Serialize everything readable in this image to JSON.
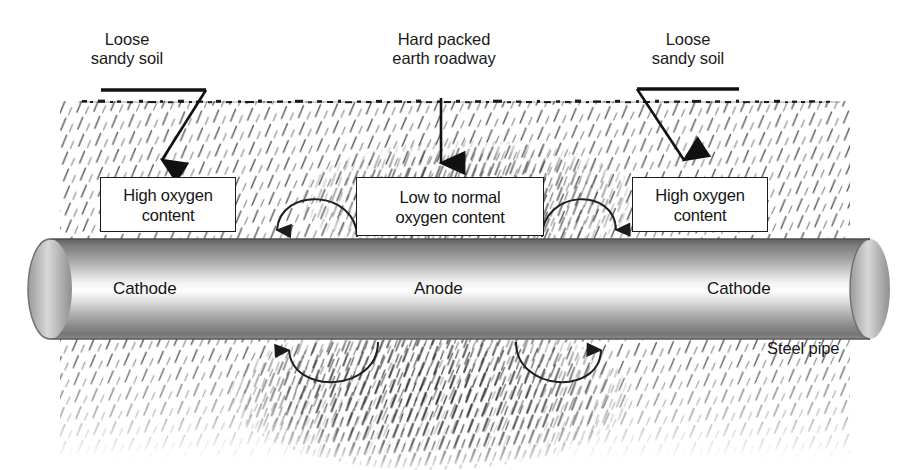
{
  "diagram": {
    "callouts": [
      {
        "id": "left-soil",
        "text": "Loose\nsandy soil"
      },
      {
        "id": "center-road",
        "text": "Hard packed\nearth roadway"
      },
      {
        "id": "right-soil",
        "text": "Loose\nsandy soil"
      }
    ],
    "boxes": [
      {
        "id": "left-oxygen",
        "text": "High oxygen\ncontent"
      },
      {
        "id": "center-oxygen",
        "text": "Low to normal\noxygen content"
      },
      {
        "id": "right-oxygen",
        "text": "High oxygen\ncontent"
      }
    ],
    "pipe_regions": [
      {
        "id": "left-cathode",
        "text": "Cathode"
      },
      {
        "id": "anode",
        "text": "Anode"
      },
      {
        "id": "right-cathode",
        "text": "Cathode"
      }
    ],
    "pipe_label": "Steel pipe",
    "colors": {
      "ink": "#1b1b1b",
      "soil_hatch": "#555555",
      "ground_line": "#111111",
      "pipe_dark": "#6e6e6e",
      "pipe_mid": "#b9b9b9",
      "pipe_highlight": "#fbfbfb",
      "box_fill": "#ffffff"
    }
  }
}
